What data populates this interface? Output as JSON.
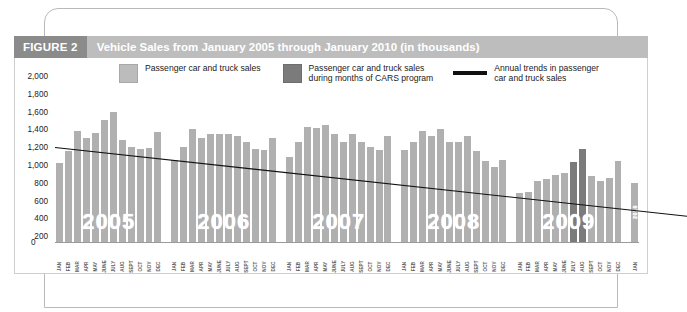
{
  "figure": {
    "tag": "FIGURE 2",
    "title": "Vehicle Sales from January 2005 through January 2010 (in thousands)"
  },
  "legend": [
    {
      "icon": "light-swatch",
      "label": "Passenger car and truck sales"
    },
    {
      "icon": "dark-swatch",
      "label": "Passenger car and truck sales\nduring months of CARS program"
    },
    {
      "icon": "black-line",
      "label": "Annual trends in passenger\ncar and truck sales"
    }
  ],
  "colors": {
    "bar": "#b0b0b0",
    "bar_cars": "#7b7b7b",
    "trend_line": "#111111",
    "title_tag_bg": "#8b8b8b",
    "title_bg": "#bdbdbd"
  },
  "chart_data": {
    "type": "bar",
    "title": "Vehicle Sales from January 2005 through January 2010 (in thousands)",
    "xlabel": "",
    "ylabel": "",
    "ylim": [
      0,
      2000
    ],
    "yticks": [
      "0",
      "200",
      "400",
      "600",
      "800",
      "1,000",
      "1,200",
      "1,400",
      "1,600",
      "1,800",
      "2,000"
    ],
    "grid": false,
    "legend_position": "top",
    "months": [
      "JAN",
      "FEB",
      "MAR",
      "APR",
      "MAY",
      "JUNE",
      "JULY",
      "AUG",
      "SEPT",
      "OCT",
      "NOV",
      "DEC"
    ],
    "groups": [
      {
        "year": "2005",
        "categories": [
          "JAN",
          "FEB",
          "MAR",
          "APR",
          "MAY",
          "JUNE",
          "JULY",
          "AUG",
          "SEPT",
          "OCT",
          "NOV",
          "DEC"
        ],
        "values": [
          1100,
          1270,
          1540,
          1450,
          1520,
          1700,
          1810,
          1420,
          1320,
          1300,
          1310,
          1530
        ],
        "cars": [
          false,
          false,
          false,
          false,
          false,
          false,
          false,
          false,
          false,
          false,
          false,
          false
        ]
      },
      {
        "year": "2006",
        "categories": [
          "JAN",
          "FEB",
          "MAR",
          "APR",
          "MAY",
          "JUNE",
          "JULY",
          "AUG",
          "SEPT",
          "OCT",
          "NOV",
          "DEC"
        ],
        "values": [
          1150,
          1330,
          1570,
          1450,
          1500,
          1500,
          1500,
          1480,
          1400,
          1290,
          1280,
          1450
        ],
        "cars": [
          false,
          false,
          false,
          false,
          false,
          false,
          false,
          false,
          false,
          false,
          false,
          false
        ]
      },
      {
        "year": "2007",
        "categories": [
          "JAN",
          "FEB",
          "MAR",
          "APR",
          "MAY",
          "JUNE",
          "JULY",
          "AUG",
          "SEPT",
          "OCT",
          "NOV",
          "DEC"
        ],
        "values": [
          1180,
          1400,
          1600,
          1590,
          1630,
          1510,
          1400,
          1510,
          1400,
          1320,
          1280,
          1480
        ],
        "cars": [
          false,
          false,
          false,
          false,
          false,
          false,
          false,
          false,
          false,
          false,
          false,
          false
        ]
      },
      {
        "year": "2008",
        "categories": [
          "JAN",
          "FEB",
          "MAR",
          "APR",
          "MAY",
          "JUNE",
          "JULY",
          "AUG",
          "SEPT",
          "OCT",
          "NOV",
          "DEC"
        ],
        "values": [
          1280,
          1400,
          1540,
          1480,
          1570,
          1400,
          1400,
          1480,
          1270,
          1130,
          1050,
          1150
        ],
        "cars": [
          false,
          false,
          false,
          false,
          false,
          false,
          false,
          false,
          false,
          false,
          false,
          false
        ]
      },
      {
        "year": "2009",
        "categories": [
          "JAN",
          "FEB",
          "MAR",
          "APR",
          "MAY",
          "JUNE",
          "JULY",
          "AUG",
          "SEPT",
          "OCT",
          "NOV",
          "DEC"
        ],
        "values": [
          690,
          700,
          860,
          880,
          940,
          960,
          1120,
          1290,
          920,
          860,
          900,
          1130
        ],
        "cars": [
          false,
          false,
          false,
          false,
          false,
          false,
          true,
          true,
          false,
          false,
          false,
          false
        ]
      },
      {
        "year": "2010",
        "categories": [
          "JAN"
        ],
        "values": [
          830
        ],
        "cars": [
          false
        ]
      }
    ],
    "trend_line": {
      "name": "Annual trends in passenger car and truck sales",
      "x_start_fraction": 0.0,
      "x_end_fraction": 1.0,
      "y_start": 1540,
      "y_end": 900
    }
  }
}
